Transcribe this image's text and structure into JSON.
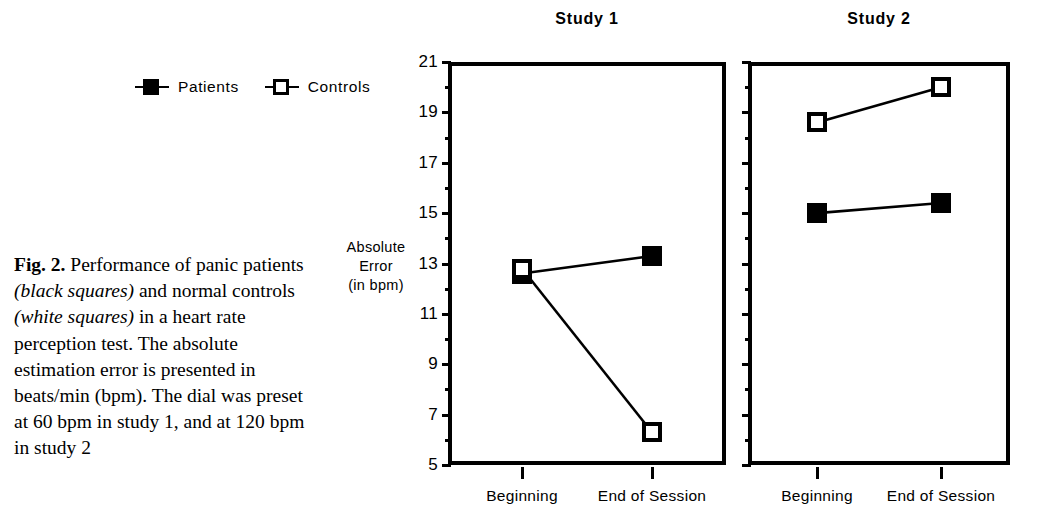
{
  "caption": {
    "figure_label": "Fig. 2.",
    "text_1": " Performance of panic patients ",
    "italic_1": "(black squares)",
    "text_2": " and normal controls ",
    "italic_2": "(white squares)",
    "text_3": " in a heart rate perception test. The absolute estimation error is presented in beats/min (bpm). The dial was preset at 60 bpm in study 1, and at 120 bpm in study 2"
  },
  "legend": {
    "items": [
      {
        "label": "Patients",
        "marker": "filled-square",
        "icon": "filled-square-icon"
      },
      {
        "label": "Controls",
        "marker": "open-square",
        "icon": "open-square-icon"
      }
    ]
  },
  "axis_title": {
    "line1": "Absolute",
    "line2": "Error",
    "line3": "(in bpm)"
  },
  "chart_data": {
    "type": "line",
    "xlabel": "",
    "ylabel": "Absolute Error (in bpm)",
    "ylim": [
      5,
      21
    ],
    "ytick_labels": [
      "21",
      "19",
      "17",
      "15",
      "13",
      "11",
      "9",
      "7",
      "5"
    ],
    "ytick_values": [
      21,
      19,
      17,
      15,
      13,
      11,
      9,
      7,
      5
    ],
    "minor_tick_values": [
      20,
      18,
      16,
      14,
      12,
      10,
      8,
      6
    ],
    "grid": false,
    "legend_position": "top-left",
    "categories": [
      "Beginning",
      "End of Session"
    ],
    "panels": [
      {
        "title": "Study 1",
        "series": [
          {
            "name": "Patients",
            "marker": "filled-square",
            "values": [
              12.6,
              13.3
            ]
          },
          {
            "name": "Controls",
            "marker": "open-square",
            "values": [
              12.8,
              6.3
            ]
          }
        ]
      },
      {
        "title": "Study 2",
        "series": [
          {
            "name": "Patients",
            "marker": "filled-square",
            "values": [
              15.0,
              15.4
            ]
          },
          {
            "name": "Controls",
            "marker": "open-square",
            "values": [
              18.6,
              20.0
            ]
          }
        ]
      }
    ]
  }
}
